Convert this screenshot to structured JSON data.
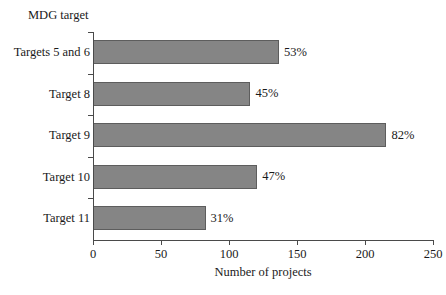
{
  "chart_data": {
    "type": "bar",
    "orientation": "horizontal",
    "title": "",
    "xlabel": "Number of projects",
    "ylabel": "MDG target",
    "categories": [
      "Targets 5 and 6",
      "Target 8",
      "Target 9",
      "Target 10",
      "Target 11"
    ],
    "values": [
      136,
      115,
      215,
      120,
      82
    ],
    "data_labels": [
      "53%",
      "45%",
      "82%",
      "47%",
      "31%"
    ],
    "xlim": [
      0,
      250
    ],
    "xticks": [
      0,
      50,
      100,
      150,
      200,
      250
    ],
    "xticklabels": [
      "0",
      "50",
      "100",
      "150",
      "200",
      "250"
    ],
    "grid": false,
    "legend": null,
    "bar_color": "#858585",
    "bar_edge_color": "#5d5d5d",
    "axis_color": "#4a4a4a",
    "background": "#ffffff"
  }
}
